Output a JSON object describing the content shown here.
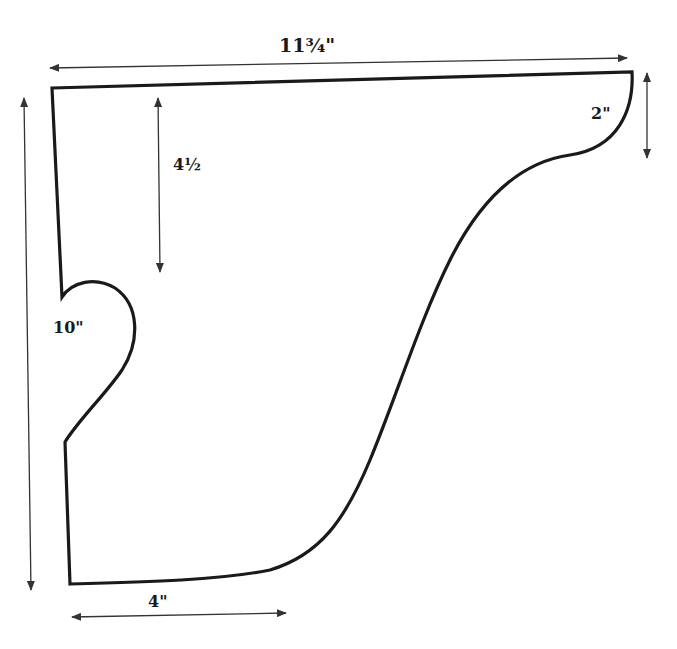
{
  "diagram": {
    "type": "dimensioned-template",
    "colors": {
      "background": "#ffffff",
      "outline": "#1a1a1a",
      "dimension_lines": "#333333"
    },
    "dimensions": {
      "overall_width": {
        "label": "11¾\"",
        "orientation": "horizontal",
        "position": "top"
      },
      "overall_height": {
        "label": "10\"",
        "orientation": "vertical",
        "position": "left"
      },
      "notch_depth": {
        "label": "4½",
        "orientation": "vertical",
        "position": "inner-left"
      },
      "top_right_drop": {
        "label": "2\"",
        "orientation": "vertical",
        "position": "right"
      },
      "bottom_width": {
        "label": "4\"",
        "orientation": "horizontal",
        "position": "bottom"
      }
    }
  }
}
